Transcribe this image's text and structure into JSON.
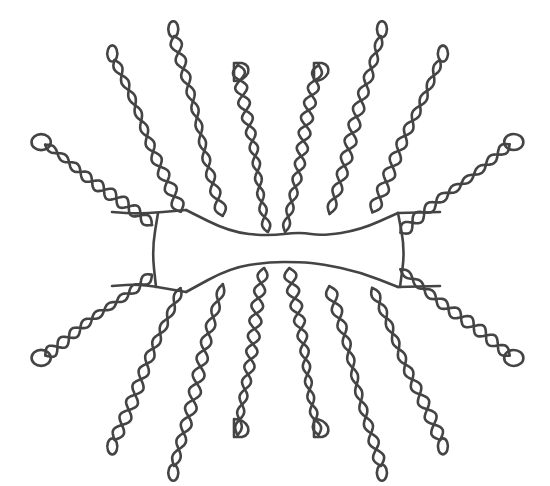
{
  "diagram": {
    "type": "branched-polymer-schematic",
    "stroke_color": "#444444",
    "background_color": "#ffffff",
    "stroke_width": 2.6,
    "backbone": {
      "top_segments": [
        [
          [
            186,
            210
          ],
          [
            230,
            232
          ],
          [
            268,
            236
          ],
          [
            300,
            232
          ],
          [
            322,
            236
          ],
          [
            360,
            230
          ],
          [
            398,
            213
          ]
        ],
        [
          [
            112,
            212
          ],
          [
            140,
            214
          ],
          [
            186,
            210
          ]
        ],
        [
          [
            398,
            213
          ],
          [
            440,
            212
          ]
        ]
      ],
      "bottom_segments": [
        [
          [
            186,
            292
          ],
          [
            230,
            268
          ],
          [
            268,
            262
          ],
          [
            300,
            262
          ],
          [
            322,
            264
          ],
          [
            360,
            272
          ],
          [
            398,
            287
          ]
        ],
        [
          [
            112,
            286
          ],
          [
            140,
            284
          ],
          [
            186,
            292
          ]
        ],
        [
          [
            398,
            287
          ],
          [
            440,
            286
          ]
        ]
      ],
      "left_arc": [
        [
          158,
          213
        ],
        [
          152,
          250
        ],
        [
          156,
          287
        ]
      ],
      "right_arc": [
        [
          398,
          213
        ],
        [
          405,
          250
        ],
        [
          400,
          287
        ]
      ]
    },
    "arms": [
      {
        "id": "top-1",
        "base": [
          152,
          225
        ],
        "tip": [
          45,
          145
        ],
        "tip_shape": "loop",
        "twists": 9
      },
      {
        "id": "top-2",
        "base": [
          180,
          212
        ],
        "tip": [
          115,
          60
        ],
        "tip_shape": "eight",
        "twists": 10
      },
      {
        "id": "top-3",
        "base": [
          222,
          216
        ],
        "tip": [
          175,
          36
        ],
        "tip_shape": "eight",
        "twists": 11
      },
      {
        "id": "top-4",
        "base": [
          268,
          232
        ],
        "tip": [
          238,
          65
        ],
        "tip_shape": "D",
        "twists": 11
      },
      {
        "id": "top-5",
        "base": [
          286,
          232
        ],
        "tip": [
          318,
          65
        ],
        "tip_shape": "D",
        "twists": 11
      },
      {
        "id": "top-6",
        "base": [
          330,
          214
        ],
        "tip": [
          380,
          36
        ],
        "tip_shape": "eight",
        "twists": 11
      },
      {
        "id": "top-7",
        "base": [
          372,
          212
        ],
        "tip": [
          440,
          60
        ],
        "tip_shape": "eight",
        "twists": 10
      },
      {
        "id": "top-8",
        "base": [
          400,
          232
        ],
        "tip": [
          510,
          145
        ],
        "tip_shape": "loop",
        "twists": 9
      },
      {
        "id": "bottom-1",
        "base": [
          152,
          275
        ],
        "tip": [
          45,
          355
        ],
        "tip_shape": "loop",
        "twists": 9
      },
      {
        "id": "bottom-2",
        "base": [
          180,
          288
        ],
        "tip": [
          115,
          440
        ],
        "tip_shape": "eight",
        "twists": 10
      },
      {
        "id": "bottom-3",
        "base": [
          222,
          284
        ],
        "tip": [
          175,
          466
        ],
        "tip_shape": "eight",
        "twists": 11
      },
      {
        "id": "bottom-4",
        "base": [
          264,
          268
        ],
        "tip": [
          238,
          435
        ],
        "tip_shape": "D",
        "twists": 11
      },
      {
        "id": "bottom-5",
        "base": [
          290,
          268
        ],
        "tip": [
          318,
          435
        ],
        "tip_shape": "D",
        "twists": 11
      },
      {
        "id": "bottom-6",
        "base": [
          330,
          286
        ],
        "tip": [
          380,
          466
        ],
        "tip_shape": "eight",
        "twists": 11
      },
      {
        "id": "bottom-7",
        "base": [
          372,
          288
        ],
        "tip": [
          440,
          440
        ],
        "tip_shape": "eight",
        "twists": 10
      },
      {
        "id": "bottom-8",
        "base": [
          400,
          270
        ],
        "tip": [
          510,
          355
        ],
        "tip_shape": "loop",
        "twists": 9
      }
    ]
  }
}
